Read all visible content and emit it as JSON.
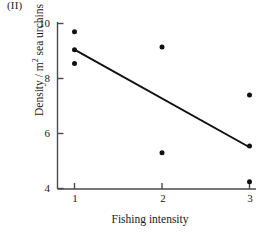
{
  "panel": {
    "label": "(II)"
  },
  "chart_data": {
    "type": "scatter",
    "title": "",
    "xlabel": "Fishing intensity",
    "ylabel_parts": {
      "prefix": "Density / m",
      "superscript": "2",
      "suffix": " sea urchins"
    },
    "ylabel": "Density / m2 sea urchins",
    "xlim": [
      0.75,
      3.25
    ],
    "ylim": [
      4,
      10
    ],
    "xticks": [
      1,
      2,
      3
    ],
    "xtick_labels": [
      "1",
      "2",
      "3"
    ],
    "yticks": [
      4,
      6,
      8,
      10
    ],
    "ytick_labels": [
      "4",
      "6",
      "8",
      "10"
    ],
    "grid": false,
    "legend": null,
    "x": [
      1,
      1,
      1,
      2,
      2,
      3,
      3,
      3
    ],
    "y": [
      9.7,
      9.05,
      8.55,
      9.15,
      5.3,
      7.4,
      5.55,
      4.25
    ],
    "points": [
      {
        "x": 1,
        "y": 9.7
      },
      {
        "x": 1,
        "y": 9.05
      },
      {
        "x": 1,
        "y": 8.55
      },
      {
        "x": 2,
        "y": 9.15
      },
      {
        "x": 2,
        "y": 5.3
      },
      {
        "x": 3,
        "y": 7.4
      },
      {
        "x": 3,
        "y": 5.55
      },
      {
        "x": 3,
        "y": 4.25
      }
    ],
    "marker": {
      "shape": "circle",
      "color": "#111111",
      "size_px": 4.6
    },
    "trendline": {
      "type": "linear-fit",
      "x_start": 1,
      "y_start": 9.05,
      "x_end": 3,
      "y_end": 5.5,
      "slope": -1.775,
      "intercept": 10.825,
      "color": "#111111",
      "width_px": 2
    },
    "axis_color": "#4a4a4a"
  }
}
